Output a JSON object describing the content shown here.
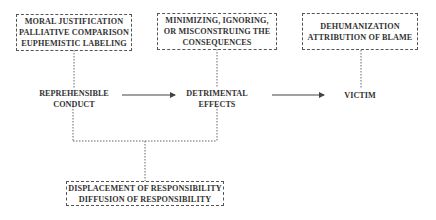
{
  "top_boxes": [
    {
      "lines": [
        "MORAL JUSTIFICATION",
        "PALLIATIVE COMPARISON",
        "EUPHEMISTIC LABELING"
      ]
    },
    {
      "lines": [
        "MINIMIZING, IGNORING,",
        "OR MISCONSTRUING THE",
        "CONSEQUENCES"
      ]
    },
    {
      "lines": [
        "DEHUMANIZATION",
        "ATTRIBUTION OF BLAME"
      ]
    }
  ],
  "flow_nodes": [
    {
      "lines": [
        "REPREHENSIBLE",
        "CONDUCT"
      ]
    },
    {
      "lines": [
        "DETRIMENTAL",
        "EFFECTS"
      ]
    },
    {
      "lines": [
        "VICTIM"
      ]
    }
  ],
  "bottom_box": {
    "lines": [
      "DISPLACEMENT OF RESPONSIBILITY",
      "DIFFUSION OF RESPONSIBILITY"
    ]
  },
  "colors": {
    "line": "#555555",
    "text": "#333333"
  }
}
